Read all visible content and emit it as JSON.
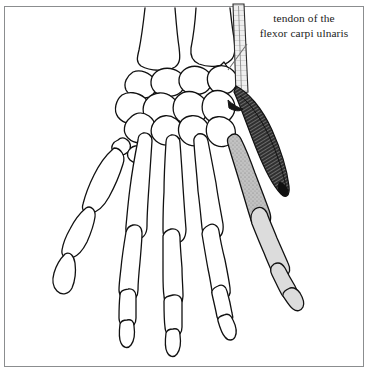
{
  "figure": {
    "kind": "anatomical-line-drawing",
    "background_color": "#ffffff",
    "ink_color": "#111111",
    "border_color": "#8b8d8f"
  },
  "annotation": {
    "line1": "tendon of the",
    "line2": "flexor carpi ulnaris",
    "leader_color": "#6e6e6e"
  },
  "shading": {
    "muscle_fill": "#3a3a3a",
    "metacarpal_v_fill": "#b9b9b9",
    "phalanx_fill": "#d7d7d7",
    "tendon_fill": "#e9e9e9"
  }
}
